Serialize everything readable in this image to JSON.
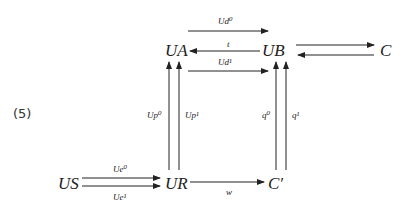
{
  "equation_number": "(5)",
  "objects": {
    "UA": "UA",
    "UB": "UB",
    "C": "C",
    "US": "US",
    "UR": "UR",
    "Cprime": "C′"
  },
  "arrows": {
    "Ud0": "Ud⁰",
    "t": "t",
    "Ud1": "Ud¹",
    "Up0": "Up⁰",
    "Up1": "Up¹",
    "q0": "q⁰",
    "q1": "q¹",
    "Ue0": "Ue⁰",
    "Ue1": "Ue¹",
    "w": "w"
  }
}
